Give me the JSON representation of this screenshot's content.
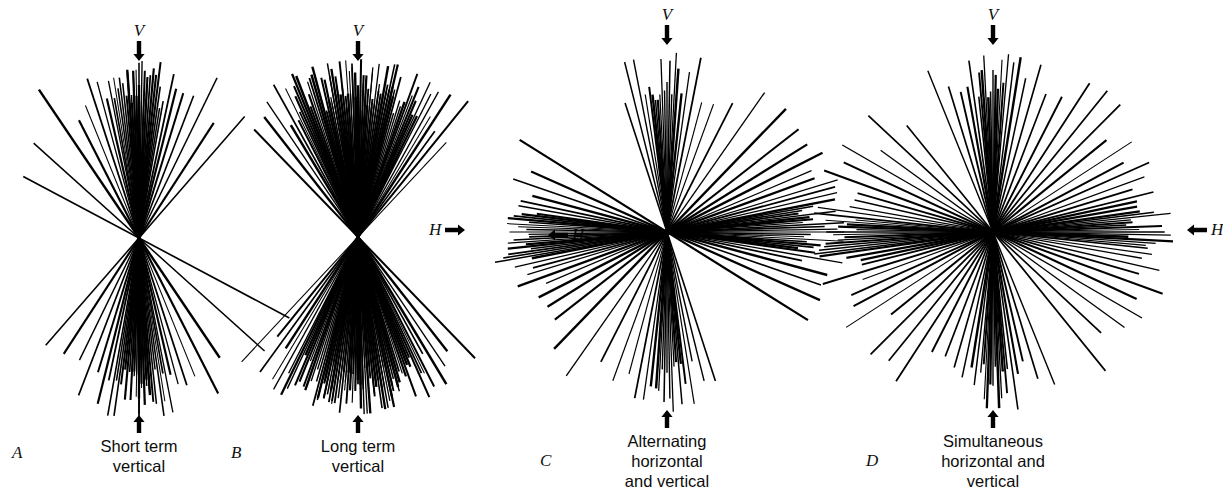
{
  "figure": {
    "background": "#ffffff",
    "ink": "#000000",
    "width": 1197,
    "height": 489
  },
  "chart_data": {
    "type": "polar-line-rose",
    "title": "",
    "xlabel": "",
    "ylabel": "",
    "angle_convention": "0 degrees = vertical (V, upward); 90 degrees = horizontal (H)",
    "axis_markers": [
      "V",
      "H"
    ],
    "grid": false,
    "legend": false,
    "panels": [
      {
        "letter": "A",
        "caption": "Short term\nvertical",
        "caption_lines": [
          "Short term",
          "vertical"
        ],
        "center": [
          139,
          238
        ],
        "radius": 182,
        "v_marker": "V",
        "v_arrow": "down-arrow-icon",
        "h_marker": "H",
        "h_arrow": "right-arrow-icon",
        "h_side": "left",
        "distribution": "unimodal, tightly clustered near vertical",
        "line_count": 46,
        "angles_deg": [
          -62,
          -48,
          -34,
          -27,
          -22,
          -18,
          -15,
          -13,
          -11,
          -10,
          -9,
          -8,
          -7,
          -6,
          -5,
          -4,
          -4,
          -3,
          -3,
          -2,
          -2,
          -1,
          -1,
          0,
          0,
          0,
          1,
          1,
          2,
          2,
          3,
          3,
          4,
          5,
          6,
          7,
          8,
          9,
          10,
          12,
          14,
          17,
          21,
          26,
          33,
          41
        ]
      },
      {
        "letter": "B",
        "caption": "Long term\nvertical",
        "caption_lines": [
          "Long term",
          "vertical"
        ],
        "center": [
          358,
          237
        ],
        "radius": 178,
        "v_marker": "V",
        "v_arrow": "down-arrow-icon",
        "h_marker": "H",
        "h_arrow": "left-arrow-icon",
        "h_side": "right",
        "distribution": "unimodal, dense near-solid vertical wedge",
        "line_count": 96,
        "angles_deg": [
          -44,
          -38,
          -34,
          -31,
          -29,
          -27,
          -26,
          -25,
          -24,
          -23,
          -22,
          -21,
          -20,
          -19,
          -18,
          -17,
          -16,
          -15,
          -15,
          -14,
          -14,
          -13,
          -13,
          -12,
          -12,
          -11,
          -11,
          -10,
          -10,
          -9,
          -9,
          -8,
          -8,
          -7,
          -7,
          -6,
          -6,
          -5,
          -5,
          -4,
          -4,
          -3,
          -3,
          -2,
          -2,
          -1,
          -1,
          0,
          0,
          1,
          1,
          2,
          2,
          3,
          3,
          4,
          4,
          5,
          5,
          6,
          6,
          7,
          7,
          8,
          8,
          9,
          9,
          10,
          10,
          11,
          11,
          12,
          12,
          13,
          13,
          14,
          14,
          15,
          16,
          17,
          18,
          19,
          20,
          21,
          22,
          23,
          24,
          25,
          26,
          27,
          29,
          31,
          33,
          36,
          39,
          43
        ]
      },
      {
        "letter": "C",
        "caption": "Alternating\nhorizontal\nand vertical",
        "caption_lines": [
          "Alternating",
          "horizontal",
          "and vertical"
        ],
        "center": [
          667,
          232
        ],
        "radius": 180,
        "v_marker": "V",
        "v_arrow": "down-arrow-icon",
        "h_marker": "H",
        "h_arrow": "right-arrow-icon",
        "h_side": "left",
        "distribution": "bimodal cross: dense at vertical and at horizontal, sparse obliques",
        "line_count": 58,
        "angles_deg": [
          -18,
          -14,
          -11,
          -9,
          -7,
          -6,
          -5,
          -4,
          -3,
          -2,
          -1,
          0,
          1,
          2,
          3,
          4,
          6,
          8,
          11,
          15,
          20,
          27,
          35,
          44,
          52,
          58,
          63,
          67,
          70,
          73,
          75,
          77,
          79,
          80,
          81,
          82,
          83,
          84,
          85,
          86,
          87,
          88,
          89,
          90,
          91,
          92,
          93,
          94,
          95,
          96,
          97,
          98,
          100,
          102,
          105,
          109,
          114,
          122
        ]
      },
      {
        "letter": "D",
        "caption": "Simultaneous\nhorizontal and\nvertical",
        "caption_lines": [
          "Simultaneous",
          "horizontal and",
          "vertical"
        ],
        "center": [
          993,
          232
        ],
        "radius": 182,
        "v_marker": "V",
        "v_arrow": "down-arrow-icon",
        "h_marker": "H",
        "h_arrow": "left-arrow-icon",
        "h_side": "right",
        "distribution": "bimodal cross with broader, more even oblique coverage",
        "line_count": 60,
        "angles_deg": [
          -22,
          -17,
          -13,
          -10,
          -8,
          -6,
          -5,
          -4,
          -3,
          -2,
          -1,
          0,
          1,
          2,
          3,
          4,
          5,
          7,
          9,
          12,
          16,
          21,
          27,
          33,
          39,
          45,
          51,
          57,
          62,
          66,
          70,
          73,
          76,
          78,
          80,
          82,
          83,
          84,
          85,
          86,
          87,
          88,
          89,
          90,
          91,
          92,
          93,
          94,
          95,
          96,
          98,
          100,
          103,
          106,
          110,
          115,
          120,
          126,
          133,
          141
        ]
      }
    ]
  }
}
